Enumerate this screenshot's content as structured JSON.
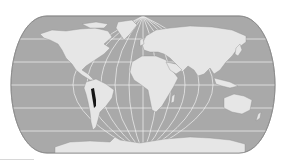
{
  "map": {
    "type": "world-locator-map",
    "projection": "pseudocylindrical (Robinson/Eckert-like), rounded sides",
    "bounds": {
      "x": 11,
      "y": 16,
      "width": 264,
      "height": 137
    },
    "colors": {
      "ocean": "#a9a9a9",
      "land": "#e6e6e6",
      "graticule": "#f4f4f4",
      "highlight": "#161616",
      "outline": "#8a8a8a",
      "background": "#ffffff"
    },
    "graticule": {
      "parallels_y": [
        39,
        62,
        85,
        108,
        131
      ],
      "meridian_center_x": 143
    },
    "highlighted_region": {
      "label": "Highlighted region in western South America (Andes: Peru / Bolivia / Chile)",
      "approx_box": {
        "x": 91,
        "y": 88,
        "width": 5,
        "height": 20
      }
    }
  },
  "footer": {
    "divider": "thin gray line, bottom-left"
  }
}
